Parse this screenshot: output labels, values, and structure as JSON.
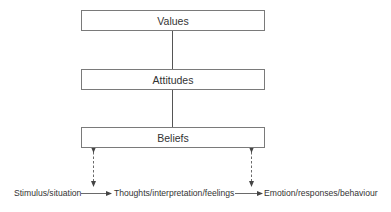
{
  "diagram": {
    "type": "hierarchy-with-process-flow",
    "boxes": [
      {
        "id": "values",
        "label": "Values"
      },
      {
        "id": "attitudes",
        "label": "Attitudes"
      },
      {
        "id": "beliefs",
        "label": "Beliefs"
      }
    ],
    "connectors": [
      {
        "from": "values",
        "to": "attitudes",
        "style": "solid"
      },
      {
        "from": "attitudes",
        "to": "beliefs",
        "style": "solid"
      },
      {
        "from": "beliefs",
        "to": "stimulus-to-thoughts-arrow",
        "style": "dashed",
        "direction": "both"
      },
      {
        "from": "beliefs",
        "to": "thoughts-to-emotion-arrow",
        "style": "dashed",
        "direction": "both"
      }
    ],
    "flow": [
      {
        "id": "stimulus",
        "label": "Stimulus/situation"
      },
      {
        "id": "thoughts",
        "label": "Thoughts/interpretation/feelings"
      },
      {
        "id": "emotion",
        "label": "Emotion/responses/behaviour"
      }
    ],
    "colors": {
      "line": "#555555",
      "box_border": "#7a7a7a",
      "text": "#333333",
      "background": "#ffffff"
    }
  }
}
